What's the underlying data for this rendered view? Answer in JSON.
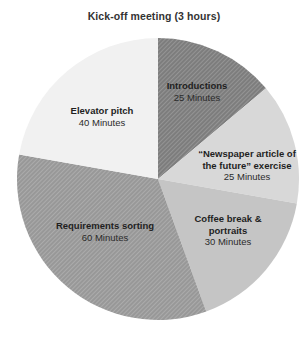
{
  "chart_data": {
    "type": "pie",
    "title": "Kick-off meeting (3 hours)",
    "unit": "minutes",
    "total_minutes": 180,
    "start_angle_deg": 0,
    "direction": "clockwise",
    "legend": "none",
    "slices": [
      {
        "name": "Introductions",
        "value": 25,
        "label_lines": [
          "Introductions"
        ],
        "sublabel": "25 Minutes",
        "color": "#7d7d7d",
        "hatch": true
      },
      {
        "name": "Newspaper article of the future exercise",
        "value": 25,
        "label_lines": [
          "“Newspaper article of",
          "the future” exercise"
        ],
        "sublabel": "25 Minutes",
        "color": "#d8d8d8",
        "hatch": false
      },
      {
        "name": "Coffee break & portraits",
        "value": 30,
        "label_lines": [
          "Coffee break &",
          "portraits"
        ],
        "sublabel": "30 Minutes",
        "color": "#c5c5c5",
        "hatch": false
      },
      {
        "name": "Requirements sorting",
        "value": 60,
        "label_lines": [
          "Requirements sorting"
        ],
        "sublabel": "60 Minutes",
        "color": "#989898",
        "hatch": true
      },
      {
        "name": "Elevator pitch",
        "value": 40,
        "label_lines": [
          "Elevator pitch"
        ],
        "sublabel": "40 Minutes",
        "color": "#f1f1f1",
        "hatch": false
      }
    ]
  }
}
